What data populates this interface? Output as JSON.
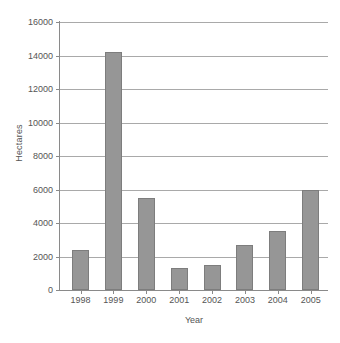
{
  "chart_data": {
    "type": "bar",
    "title": "",
    "xlabel": "Year",
    "ylabel": "Hectares",
    "categories": [
      "1998",
      "1999",
      "2000",
      "2001",
      "2002",
      "2003",
      "2004",
      "2005"
    ],
    "values": [
      2400,
      14200,
      5500,
      1300,
      1500,
      2700,
      3500,
      5950
    ],
    "ylim": [
      0,
      16000
    ],
    "yticks": [
      0,
      2000,
      4000,
      6000,
      8000,
      10000,
      12000,
      14000,
      16000
    ],
    "ytick_labels": [
      "0",
      "2000",
      "4000",
      "6000",
      "8000",
      "10000",
      "12000",
      "14000",
      "16000"
    ],
    "grid": "horizontal",
    "legend": "none",
    "series": [
      {
        "name": "Hectares",
        "values": [
          2400,
          14200,
          5500,
          1300,
          1500,
          2700,
          3500,
          5950
        ]
      }
    ],
    "colors": {
      "bar_fill": "#969696",
      "bar_border": "#7d7d7d",
      "gridline": "#a9a9a9",
      "axis": "#8a8a8a",
      "text": "#555555",
      "background": "#ffffff"
    }
  },
  "caption": {
    "clipped_text": ""
  }
}
